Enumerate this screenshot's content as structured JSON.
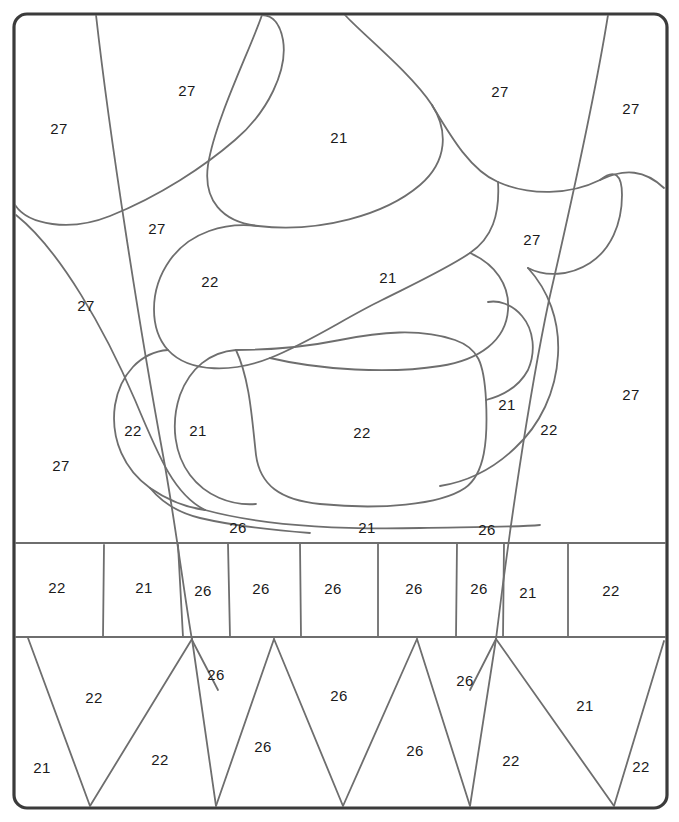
{
  "figure": {
    "kind": "paint-by-number-segmentation-diagram",
    "title": "",
    "frame": {
      "x": 14,
      "y": 14,
      "width": 653,
      "height": 794,
      "corner_radius": 13,
      "stroke_color": "#3b3b3b",
      "stroke_width": 3.2,
      "fill_color": "#ffffff"
    },
    "line_color": "#6e6e6e",
    "line_width": 1.8,
    "label_color": "#1a1a1a",
    "label_font_size": 15,
    "palette_numbers": [
      "21",
      "22",
      "26",
      "27"
    ],
    "bands": {
      "upper_curved_band": {
        "top": 14,
        "bottom": 543
      },
      "middle_rectangle_band": {
        "top": 543,
        "bottom": 637
      },
      "lower_triangle_band": {
        "top": 637,
        "bottom": 808
      }
    },
    "labels": [
      {
        "id": "l01",
        "text": "27",
        "x": 187,
        "y": 92
      },
      {
        "id": "l02",
        "text": "27",
        "x": 59,
        "y": 130
      },
      {
        "id": "l03",
        "text": "21",
        "x": 339,
        "y": 139
      },
      {
        "id": "l04",
        "text": "27",
        "x": 500,
        "y": 93
      },
      {
        "id": "l05",
        "text": "27",
        "x": 631,
        "y": 110
      },
      {
        "id": "l06",
        "text": "27",
        "x": 157,
        "y": 230
      },
      {
        "id": "l07",
        "text": "27",
        "x": 532,
        "y": 241
      },
      {
        "id": "l08",
        "text": "22",
        "x": 210,
        "y": 283
      },
      {
        "id": "l09",
        "text": "21",
        "x": 388,
        "y": 279
      },
      {
        "id": "l10",
        "text": "27",
        "x": 86,
        "y": 307
      },
      {
        "id": "l11",
        "text": "27",
        "x": 631,
        "y": 396
      },
      {
        "id": "l12",
        "text": "22",
        "x": 133,
        "y": 432
      },
      {
        "id": "l13",
        "text": "21",
        "x": 198,
        "y": 432
      },
      {
        "id": "l14",
        "text": "22",
        "x": 362,
        "y": 434
      },
      {
        "id": "l15",
        "text": "21",
        "x": 507,
        "y": 406
      },
      {
        "id": "l16",
        "text": "22",
        "x": 549,
        "y": 431
      },
      {
        "id": "l17",
        "text": "27",
        "x": 61,
        "y": 467
      },
      {
        "id": "l18",
        "text": "26",
        "x": 238,
        "y": 529
      },
      {
        "id": "l19",
        "text": "21",
        "x": 367,
        "y": 529
      },
      {
        "id": "l20",
        "text": "26",
        "x": 487,
        "y": 531
      },
      {
        "id": "l21",
        "text": "22",
        "x": 57,
        "y": 589
      },
      {
        "id": "l22",
        "text": "21",
        "x": 144,
        "y": 589
      },
      {
        "id": "l23",
        "text": "26",
        "x": 203,
        "y": 592
      },
      {
        "id": "l24",
        "text": "26",
        "x": 261,
        "y": 590
      },
      {
        "id": "l25",
        "text": "26",
        "x": 333,
        "y": 590
      },
      {
        "id": "l26",
        "text": "26",
        "x": 414,
        "y": 590
      },
      {
        "id": "l27",
        "text": "26",
        "x": 479,
        "y": 590
      },
      {
        "id": "l28",
        "text": "21",
        "x": 528,
        "y": 594
      },
      {
        "id": "l29",
        "text": "22",
        "x": 611,
        "y": 592
      },
      {
        "id": "l30",
        "text": "22",
        "x": 94,
        "y": 699
      },
      {
        "id": "l31",
        "text": "26",
        "x": 216,
        "y": 676
      },
      {
        "id": "l32",
        "text": "26",
        "x": 339,
        "y": 697
      },
      {
        "id": "l33",
        "text": "26",
        "x": 465,
        "y": 682
      },
      {
        "id": "l34",
        "text": "21",
        "x": 585,
        "y": 707
      },
      {
        "id": "l35",
        "text": "21",
        "x": 42,
        "y": 769
      },
      {
        "id": "l36",
        "text": "22",
        "x": 160,
        "y": 761
      },
      {
        "id": "l37",
        "text": "26",
        "x": 263,
        "y": 748
      },
      {
        "id": "l38",
        "text": "26",
        "x": 415,
        "y": 752
      },
      {
        "id": "l39",
        "text": "22",
        "x": 511,
        "y": 762
      },
      {
        "id": "l40",
        "text": "22",
        "x": 641,
        "y": 768
      }
    ],
    "paths": {
      "long_diagonal_left": "M 96,15 C 110,140 140,330 163,455 C 175,520 185,600 192,640",
      "long_diagonal_left_lower": "M 192,640 L 218,690",
      "long_diagonal_right": "M 608,15 C 596,90 572,200 549,300 C 528,400 508,540 496,639",
      "long_diagonal_right_lower": "M 496,639 L 470,690",
      "blob_top_left_lobe": "M 15,205 C 28,225 70,232 110,216 C 160,196 205,166 235,140 C 268,112 288,70 283,40 C 279,18 268,15 262,15",
      "curve_left_long_sweep": "M 16,215 C 60,250 105,330 135,400 C 160,460 175,495 205,510",
      "curve_under_topleft": "M 205,510 C 260,525 330,530 420,528 C 480,527 520,527 540,525",
      "top_center_big_blob": "M 262,15 C 250,50 215,120 208,165 C 203,200 222,222 258,226 C 320,233 385,215 420,185 C 448,161 448,130 432,105 C 410,72 360,32 345,15",
      "blob_right_of_center_top": "M 432,105 C 450,135 470,170 498,182 C 530,196 570,195 600,180 C 625,168 645,170 664,188",
      "midband_22_blob": "M 258,226 C 225,222 190,232 170,260 C 148,291 150,330 168,350 C 190,374 235,372 270,358 C 310,342 345,318 382,300 C 420,281 448,268 470,253 C 492,238 500,215 498,182",
      "midband_21_blob": "M 470,253 C 495,264 510,285 508,310 C 506,340 480,360 440,366 C 390,374 320,370 270,358",
      "right_upper_bulge": "M 600,180 C 615,168 622,175 622,195 C 622,225 610,250 590,263 C 570,276 545,277 528,268",
      "center_big_rounded_rect": "M 236,350 C 250,380 252,420 256,455 C 260,485 280,500 320,504 C 380,510 440,505 465,488 C 485,474 488,440 486,400 C 484,362 478,348 455,340 C 420,328 380,332 340,340 C 300,348 260,350 236,350",
      "left_small_22_lobe": "M 168,350 C 140,352 120,375 115,405 C 110,440 125,470 150,488 C 170,502 190,508 205,510",
      "center_22_inner": "M 236,350 C 210,352 190,368 180,395 C 170,425 175,455 190,475 C 205,495 230,506 256,504",
      "right_21_lobe": "M 486,400 C 505,395 520,385 528,370 C 536,352 534,330 522,316 C 512,304 498,300 488,302",
      "right_22_sliver": "M 528,268 C 548,290 560,320 558,355 C 556,392 540,425 515,448 C 492,470 465,482 440,486",
      "lower_left_curve_to_band": "M 150,488 C 160,500 175,512 200,518 C 230,525 270,530 310,533",
      "band_top_line": "M 15,543 L 666,543",
      "band_bottom_line": "M 15,637 L 666,637",
      "band_divider_1": "M 104,545 L 103,637",
      "band_divider_2": "M 178,545 L 183,637",
      "band_divider_3": "M 228,544 L 230,637",
      "band_divider_4": "M 300,544 L 301,637",
      "band_divider_5": "M 378,543 L 378,637",
      "band_divider_6": "M 457,543 L 456,637",
      "band_divider_7": "M 504,543 L 503,637",
      "band_divider_8": "M 568,543 L 568,637",
      "tri_1": "M 90,806 L 28,638",
      "tri_2": "M 90,806 L 192,639",
      "tri_3": "M 216,806 L 192,639",
      "tri_4": "M 216,806 L 274,639",
      "tri_5": "M 343,806 L 274,639",
      "tri_6": "M 343,806 L 417,639",
      "tri_7": "M 470,806 L 417,639",
      "tri_8": "M 470,806 L 496,639",
      "tri_9": "M 614,806 L 496,639",
      "tri_10": "M 614,806 L 664,641"
    }
  }
}
